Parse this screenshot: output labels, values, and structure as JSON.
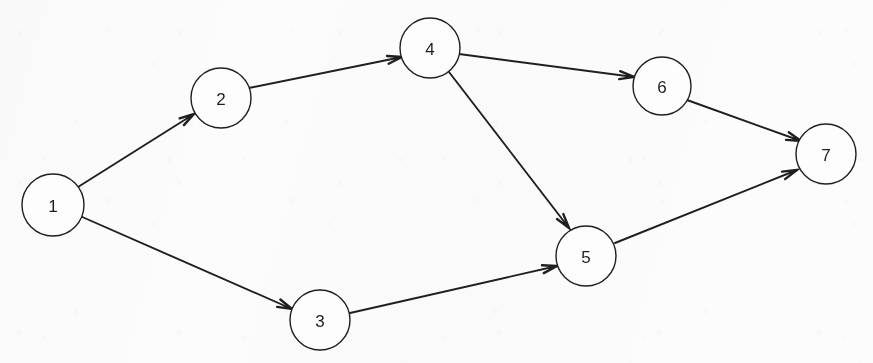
{
  "figure": {
    "type": "directed-graph",
    "background_color": "#fcfcfc",
    "ink_color": "#1f1f1f",
    "node_fill": "#fdfdfd",
    "node_stroke_width": 1.4,
    "edge_stroke_width": 1.9,
    "label_font_size": 17
  },
  "nodes": [
    {
      "id": "1",
      "label": "1",
      "cx": 53,
      "cy": 205,
      "r": 31
    },
    {
      "id": "2",
      "label": "2",
      "cx": 221,
      "cy": 98,
      "r": 30
    },
    {
      "id": "3",
      "label": "3",
      "cx": 320,
      "cy": 320,
      "r": 30
    },
    {
      "id": "4",
      "label": "4",
      "cx": 430,
      "cy": 48,
      "r": 30
    },
    {
      "id": "5",
      "label": "5",
      "cx": 586,
      "cy": 256,
      "r": 30
    },
    {
      "id": "6",
      "label": "6",
      "cx": 662,
      "cy": 86,
      "r": 29
    },
    {
      "id": "7",
      "label": "7",
      "cx": 826,
      "cy": 154,
      "r": 30
    }
  ],
  "edges": [
    {
      "id": "e1",
      "from": "1",
      "to": "2",
      "directed": true,
      "x1": 78,
      "y1": 187,
      "x2": 194,
      "y2": 114
    },
    {
      "id": "e2",
      "from": "1",
      "to": "3",
      "directed": true,
      "x1": 80,
      "y1": 216,
      "x2": 292,
      "y2": 309
    },
    {
      "id": "e3",
      "from": "2",
      "to": "4",
      "directed": true,
      "x1": 249,
      "y1": 88,
      "x2": 402,
      "y2": 57
    },
    {
      "id": "e4",
      "from": "4",
      "to": "6",
      "directed": true,
      "x1": 459,
      "y1": 54,
      "x2": 634,
      "y2": 77
    },
    {
      "id": "e5",
      "from": "4",
      "to": "5",
      "directed": true,
      "x1": 449,
      "y1": 72,
      "x2": 569,
      "y2": 228
    },
    {
      "id": "e6",
      "from": "3",
      "to": "5",
      "directed": true,
      "x1": 350,
      "y1": 313,
      "x2": 557,
      "y2": 266
    },
    {
      "id": "e7",
      "from": "6",
      "to": "7",
      "directed": true,
      "x1": 687,
      "y1": 100,
      "x2": 801,
      "y2": 141
    },
    {
      "id": "e8",
      "from": "5",
      "to": "7",
      "directed": true,
      "x1": 615,
      "y1": 243,
      "x2": 797,
      "y2": 170
    }
  ],
  "chart_data": {
    "type": "diagram",
    "title": "",
    "node_ids": [
      "1",
      "2",
      "3",
      "4",
      "5",
      "6",
      "7"
    ],
    "adjacency": [
      [
        "1",
        "2"
      ],
      [
        "1",
        "3"
      ],
      [
        "2",
        "4"
      ],
      [
        "4",
        "6"
      ],
      [
        "4",
        "5"
      ],
      [
        "3",
        "5"
      ],
      [
        "6",
        "7"
      ],
      [
        "5",
        "7"
      ]
    ],
    "source_nodes": [
      "1"
    ],
    "sink_nodes": [
      "7"
    ]
  }
}
